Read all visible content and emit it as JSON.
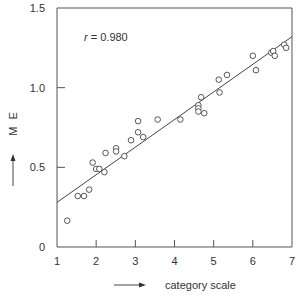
{
  "chart_data": {
    "type": "scatter",
    "title": "",
    "xlabel": "category scale",
    "ylabel": "M E",
    "xlim": [
      1,
      7
    ],
    "ylim": [
      0,
      1.5
    ],
    "xticks": [
      1,
      2,
      3,
      4,
      5,
      6,
      7
    ],
    "xtick_labels": [
      "1",
      "2",
      "3",
      "4",
      "5",
      "6",
      "7"
    ],
    "yticks": [
      0,
      0.5,
      1.0,
      1.5
    ],
    "ytick_labels": [
      "0",
      "0.5",
      "1.0",
      "1.5"
    ],
    "grid": false,
    "legend": null,
    "annotation": {
      "r_symbol": "r",
      "text": " = 0.980",
      "r_value": 0.98
    },
    "regression_line": {
      "x": [
        1,
        7
      ],
      "y": [
        0.28,
        1.32
      ]
    },
    "series": [
      {
        "name": "observations",
        "marker": "open-circle",
        "x": [
          1.26,
          1.53,
          1.69,
          1.82,
          1.91,
          2.0,
          2.08,
          2.21,
          2.24,
          2.51,
          2.51,
          2.72,
          2.89,
          3.07,
          3.07,
          3.2,
          3.57,
          4.15,
          4.61,
          4.61,
          4.61,
          4.68,
          4.76,
          5.13,
          5.15,
          5.34,
          6.0,
          6.08,
          6.47,
          6.52,
          6.56,
          6.8,
          6.85
        ],
        "y": [
          0.165,
          0.32,
          0.32,
          0.36,
          0.53,
          0.49,
          0.49,
          0.47,
          0.59,
          0.62,
          0.6,
          0.57,
          0.67,
          0.79,
          0.72,
          0.69,
          0.8,
          0.8,
          0.89,
          0.87,
          0.85,
          0.94,
          0.84,
          1.05,
          0.97,
          1.08,
          1.2,
          1.11,
          1.22,
          1.23,
          1.2,
          1.27,
          1.25
        ]
      }
    ]
  },
  "labels": {
    "x_axis_label": "category scale",
    "y_axis_label": "M E"
  }
}
